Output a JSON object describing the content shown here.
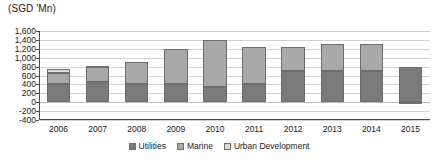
{
  "chart_data": {
    "type": "bar",
    "stacked": true,
    "title": "",
    "subtitle": "",
    "units_label": "(SGD 'Mn)",
    "xlabel": "",
    "ylabel": "",
    "ylim": [
      -400,
      1600
    ],
    "ytick_step": 200,
    "ytick_labels": [
      "1,600",
      "1,400",
      "1,200",
      "1,000",
      "800",
      "600",
      "400",
      "200",
      "0",
      "-200",
      "-400"
    ],
    "ytick_values": [
      1600,
      1400,
      1200,
      1000,
      800,
      600,
      400,
      200,
      0,
      -200,
      -400
    ],
    "grid": true,
    "legend_position": "bottom",
    "categories": [
      "2006",
      "2007",
      "2008",
      "2009",
      "2010",
      "2011",
      "2012",
      "2013",
      "2014",
      "2015"
    ],
    "series": [
      {
        "name": "Utilities",
        "color": "#7a7a7a",
        "values": [
          400,
          450,
          400,
          400,
          350,
          400,
          700,
          700,
          700,
          800
        ]
      },
      {
        "name": "Marine",
        "color": "#a8a8a8",
        "values": [
          250,
          330,
          500,
          800,
          1050,
          850,
          550,
          600,
          600,
          0
        ]
      },
      {
        "name": "Urban Development",
        "color": "#dcdcdc",
        "values": [
          100,
          40,
          0,
          0,
          0,
          0,
          0,
          0,
          0,
          -50
        ]
      }
    ],
    "totals": [
      750,
      820,
      900,
      1200,
      1400,
      1250,
      1250,
      1300,
      1300,
      750
    ]
  },
  "legend": {
    "items": [
      {
        "label": "Utilities",
        "swatch": "utilities"
      },
      {
        "label": "Marine",
        "swatch": "marine"
      },
      {
        "label": "Urban Development",
        "swatch": "urban"
      }
    ]
  }
}
